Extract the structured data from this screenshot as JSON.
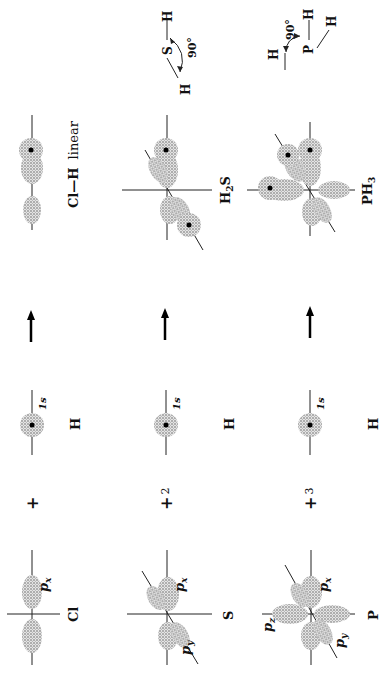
{
  "figure": {
    "orientation": "rotated 90° counterclockwise",
    "rows": [
      {
        "atom": "Cl",
        "atom_orbital": "p_x",
        "plus": "+",
        "coefficient": "",
        "h_atom": "H",
        "h_orbital": "1s",
        "product_label": "Cl—H  linear"
      },
      {
        "atom": "S",
        "atom_orbitals": [
          "p_x",
          "p_y"
        ],
        "plus": "+",
        "coefficient": "2",
        "h_atom": "H",
        "h_orbital": "1s",
        "product_label": "H2S",
        "geometry": {
          "center": "S",
          "h1": "H",
          "h2": "H",
          "angle": "90°"
        }
      },
      {
        "atom": "P",
        "atom_orbitals": [
          "p_x",
          "p_y",
          "p_z"
        ],
        "plus": "+",
        "coefficient": "3",
        "h_atom": "H",
        "h_orbital": "1s",
        "product_label": "PH3",
        "geometry": {
          "center": "P",
          "h1": "H",
          "h2": "H",
          "h3": "H",
          "angle": "90°"
        }
      }
    ],
    "labels": {
      "cl": "Cl",
      "s": "S",
      "p": "P",
      "h": "H",
      "px": "p",
      "px_sub": "x",
      "py": "p",
      "py_sub": "y",
      "pz": "p",
      "pz_sub": "z",
      "one_s": "1s",
      "plus": "+",
      "two": "2",
      "three": "3",
      "clh": "Cl—H",
      "linear": "linear",
      "h2s_h": "H",
      "h2s_2": "2",
      "h2s_s": "S",
      "ph3_p": "PH",
      "ph3_3": "3",
      "deg90": "90°"
    }
  }
}
